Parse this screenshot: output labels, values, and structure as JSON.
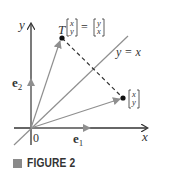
{
  "figure": {
    "caption": "FIGURE 2",
    "labels": {
      "y_axis": "y",
      "x_axis": "x",
      "origin": "0",
      "e1": "e",
      "e1_sub": "1",
      "e2": "e",
      "e2_sub": "2",
      "line": "y = x",
      "transform_lhs": "T",
      "vec_top": "x",
      "vec_bottom": "y",
      "equals": "=",
      "img_top": "y",
      "img_bottom": "x"
    },
    "colors": {
      "axis": "#333333",
      "vector": "#8f8f8f",
      "point": "#111111"
    }
  }
}
